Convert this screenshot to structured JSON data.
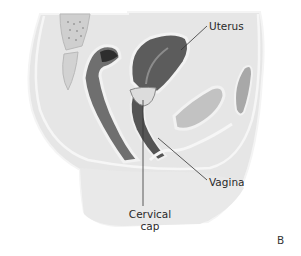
{
  "figure": {
    "panel_letter": "B",
    "labels": {
      "uterus": "Uterus",
      "vagina": "Vagina",
      "cervical_cap_line1": "Cervical",
      "cervical_cap_line2": "cap"
    },
    "colors": {
      "background": "#ffffff",
      "body_fill": "#e6e6e6",
      "body_edge": "#f7f7f7",
      "uterus": "#5e5e5e",
      "rectum": "#6a6a6a",
      "bladder": "#bdbdbd",
      "bone": "#c9c9c9",
      "cap": "#d8d8d8",
      "leader_line": "#333333",
      "text": "#2a2a2a"
    }
  }
}
